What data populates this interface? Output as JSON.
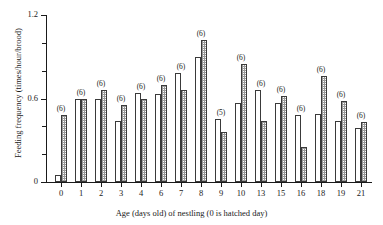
{
  "chart_data": {
    "type": "bar",
    "title": "",
    "xlabel": "Age (days old) of nestling (0 is hatched day)",
    "ylabel": "Feeding frequency (times/hour/brood)",
    "categories": [
      "0",
      "1",
      "2",
      "3",
      "4",
      "6",
      "7",
      "8",
      "9",
      "10",
      "13",
      "15",
      "16",
      "18",
      "19",
      "21"
    ],
    "ylim": [
      0,
      1.2
    ],
    "ytick_labels": [
      "0",
      "0.6",
      "1.2"
    ],
    "ytick_values": [
      0,
      0.6,
      1.2
    ],
    "yminor_tick_values": [
      0.2,
      0.4,
      0.8,
      1.0
    ],
    "grid": false,
    "legend_position": "none",
    "series": [
      {
        "name": "open",
        "fill": "open-white",
        "values": [
          0.05,
          0.6,
          0.6,
          0.44,
          0.64,
          0.63,
          0.78,
          0.9,
          0.45,
          0.57,
          0.66,
          0.57,
          0.48,
          0.49,
          0.44,
          0.39
        ]
      },
      {
        "name": "hatched",
        "fill": "hatched-grey",
        "values": [
          0.48,
          0.6,
          0.66,
          0.55,
          0.6,
          0.7,
          0.66,
          1.02,
          0.36,
          0.85,
          0.44,
          0.62,
          0.25,
          0.76,
          0.58,
          0.43
        ]
      }
    ],
    "annotations": [
      "(6)",
      "(6)",
      "(6)",
      "(6)",
      "(6)",
      "(6)",
      "(6)",
      "(6)",
      "(5)",
      "(6)",
      "(6)",
      "(6)",
      "(6)",
      "(6)",
      "(6)",
      "(6)"
    ]
  },
  "colors": {
    "axis": "#1a1a1a",
    "bar_edge": "#3a3a3a",
    "bar_open_fill": "#ffffff",
    "bar_hatch": "#9a9a9a",
    "background": "#ffffff"
  }
}
